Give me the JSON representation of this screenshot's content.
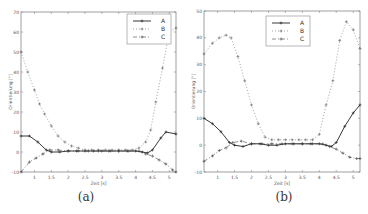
{
  "captions": {
    "a": "(a)",
    "b": "(b)"
  },
  "chart_data": [
    {
      "type": "line",
      "panel": "a",
      "title": "",
      "xlabel": "Zeit [s]",
      "ylabel": "Orientierung [°]",
      "xlim": [
        0.6,
        5.2
      ],
      "ylim": [
        -10,
        70
      ],
      "xticks": [
        1,
        1.5,
        2,
        2.5,
        3,
        3.5,
        4,
        4.5,
        5
      ],
      "xtick_labels": [
        "1",
        "1.5",
        "2",
        "2.5",
        "3",
        "3.5",
        "4",
        "4.5",
        "5"
      ],
      "yticks": [
        -10,
        0,
        10,
        20,
        30,
        40,
        50,
        60,
        70
      ],
      "ytick_labels": [
        "-10",
        "0",
        "10",
        "20",
        "30",
        "40",
        "50",
        "60",
        "70"
      ],
      "grid": false,
      "legend_position": "upper right",
      "series": [
        {
          "name": "A",
          "style": "solid line with + markers",
          "color": "#222222",
          "x": [
            0.6,
            0.85,
            1.1,
            1.35,
            1.5,
            1.75,
            2.0,
            2.25,
            2.5,
            2.75,
            3.0,
            3.25,
            3.5,
            3.75,
            4.0,
            4.2,
            4.35,
            4.5,
            4.75,
            4.9,
            5.2
          ],
          "y": [
            8,
            8,
            5,
            1,
            0,
            0,
            0.5,
            0.5,
            0.5,
            0.5,
            0.5,
            0.5,
            0.5,
            0.5,
            0.5,
            0,
            -0.5,
            1,
            7,
            10,
            9
          ]
        },
        {
          "name": "B",
          "style": "dotted line with + markers",
          "color": "#666666",
          "x": [
            0.6,
            0.8,
            1.0,
            1.15,
            1.3,
            1.5,
            1.7,
            1.9,
            2.1,
            2.3,
            2.5,
            2.7,
            2.9,
            3.1,
            3.3,
            3.5,
            3.7,
            3.9,
            4.1,
            4.3,
            4.45,
            4.6,
            4.8,
            5.0,
            5.2
          ],
          "y": [
            50,
            40,
            31,
            24,
            19,
            13,
            8,
            5,
            3,
            2,
            1,
            1,
            1,
            1,
            1,
            1,
            1,
            1,
            2,
            5,
            11,
            25,
            42,
            60,
            62
          ]
        },
        {
          "name": "C",
          "style": "dash-dot line with + markers",
          "color": "#444444",
          "x": [
            0.6,
            0.85,
            1.05,
            1.25,
            1.45,
            1.7,
            2.0,
            2.3,
            2.6,
            2.9,
            3.2,
            3.5,
            3.8,
            4.1,
            4.3,
            4.5,
            4.7,
            4.9,
            5.1,
            5.2
          ],
          "y": [
            -10,
            -5,
            -3,
            -1,
            1,
            1,
            0.5,
            0.5,
            0.5,
            0.5,
            0.5,
            0.5,
            0.5,
            0.5,
            -1,
            -2,
            -4,
            -6,
            -9,
            -10
          ]
        }
      ]
    },
    {
      "type": "line",
      "panel": "b",
      "title": "",
      "xlabel": "Zeit [s]",
      "ylabel": "Orientierung [°]",
      "xlim": [
        0.6,
        5.2
      ],
      "ylim": [
        -10,
        50
      ],
      "xticks": [
        1,
        1.5,
        2,
        2.5,
        3,
        3.5,
        4,
        4.5,
        5
      ],
      "xtick_labels": [
        "1",
        "1.5",
        "2",
        "2.5",
        "3",
        "3.5",
        "4",
        "4.5",
        "5"
      ],
      "yticks": [
        -10,
        0,
        10,
        20,
        30,
        40,
        50
      ],
      "ytick_labels": [
        "-10",
        "0",
        "10",
        "20",
        "30",
        "40",
        "50"
      ],
      "grid": false,
      "legend_position": "upper center",
      "series": [
        {
          "name": "A",
          "style": "solid line with + markers",
          "color": "#222222",
          "x": [
            0.6,
            0.85,
            1.1,
            1.35,
            1.5,
            1.75,
            2.0,
            2.25,
            2.5,
            2.75,
            3.0,
            3.25,
            3.5,
            3.75,
            4.0,
            4.2,
            4.35,
            4.5,
            4.75,
            5.0,
            5.2
          ],
          "y": [
            10,
            8,
            5,
            1,
            0,
            -0.5,
            0.5,
            0.5,
            0,
            0,
            0.5,
            0.5,
            0.5,
            0.5,
            0.5,
            0,
            -0.5,
            1,
            7,
            12,
            15
          ]
        },
        {
          "name": "B",
          "style": "dotted line with + markers",
          "color": "#666666",
          "x": [
            0.6,
            0.85,
            1.05,
            1.25,
            1.4,
            1.6,
            1.8,
            2.0,
            2.2,
            2.4,
            2.6,
            2.8,
            3.0,
            3.2,
            3.4,
            3.6,
            3.8,
            4.0,
            4.2,
            4.4,
            4.6,
            4.8,
            5.0,
            5.2
          ],
          "y": [
            34,
            38,
            40,
            41,
            40,
            33,
            24,
            15,
            8,
            3,
            2,
            2,
            2,
            2,
            2,
            2,
            2,
            4,
            15,
            24,
            39,
            46,
            43,
            36
          ]
        },
        {
          "name": "C",
          "style": "dash-dot line with + markers",
          "color": "#444444",
          "x": [
            0.6,
            0.85,
            1.05,
            1.25,
            1.45,
            1.7,
            2.0,
            2.3,
            2.6,
            2.9,
            3.2,
            3.5,
            3.8,
            4.1,
            4.3,
            4.5,
            4.7,
            4.9,
            5.1,
            5.2
          ],
          "y": [
            -6,
            -4,
            -2,
            -1,
            1,
            1.5,
            0.5,
            0.5,
            0.5,
            0.5,
            0.5,
            0.5,
            0.5,
            0.5,
            -0.5,
            -1.5,
            -3,
            -4.5,
            -5,
            -5
          ]
        }
      ]
    }
  ]
}
